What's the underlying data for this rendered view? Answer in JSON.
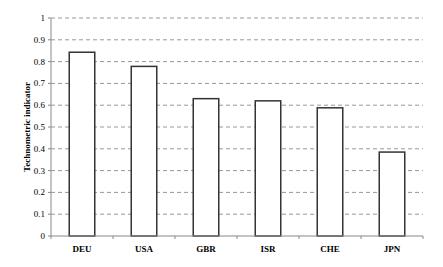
{
  "chart_data": {
    "type": "bar",
    "title": "",
    "xlabel": "",
    "ylabel": "Technometric indicator",
    "categories": [
      "DEU",
      "USA",
      "GBR",
      "ISR",
      "CHE",
      "JPN"
    ],
    "values": [
      0.843,
      0.778,
      0.63,
      0.62,
      0.588,
      0.385
    ],
    "ylim": [
      0,
      1
    ],
    "yticks": [
      "0",
      "0.1",
      "0.2",
      "0.3",
      "0.4",
      "0.5",
      "0.6",
      "0.7",
      "0.8",
      "0.9",
      "1"
    ],
    "grid": "horizontal dashed",
    "legend": "none",
    "colors": {
      "bar_fill": "#ffffff",
      "bar_stroke": "#333333",
      "grid": "#999999",
      "axis": "#888888"
    }
  }
}
